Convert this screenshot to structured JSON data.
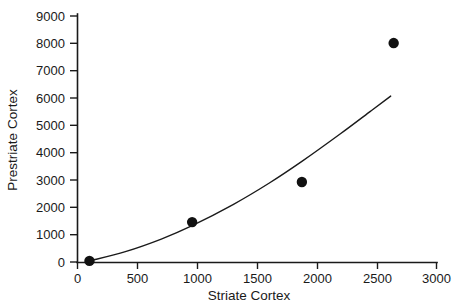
{
  "chart_data": {
    "type": "scatter",
    "title": "",
    "subtitle": "",
    "xlabel": "Striate Cortex",
    "ylabel": "Prestriate Cortex",
    "xlim": [
      0,
      3000
    ],
    "ylim": [
      0,
      9000
    ],
    "xticks": [
      0,
      500,
      1000,
      1500,
      2000,
      2500,
      3000
    ],
    "yticks": [
      0,
      1000,
      2000,
      3000,
      4000,
      5000,
      6000,
      7000,
      8000,
      9000
    ],
    "xticklabels": [
      "0",
      "500",
      "1000",
      "1500",
      "2000",
      "2500",
      "3000"
    ],
    "yticklabels": [
      "0",
      "1000",
      "2000",
      "3000",
      "4000",
      "5000",
      "6000",
      "7000",
      "8000",
      "9000"
    ],
    "grid": false,
    "legend": null,
    "series": [
      {
        "name": "observations",
        "type": "scatter",
        "marker": "filled-circle",
        "color": "#111111",
        "points": [
          {
            "x": 100,
            "y": 40
          },
          {
            "x": 958,
            "y": 1460
          },
          {
            "x": 1875,
            "y": 2925
          },
          {
            "x": 2642,
            "y": 8010
          }
        ]
      },
      {
        "name": "fitted-curve",
        "type": "line",
        "color": "#1a1a1a",
        "points": [
          {
            "x": 100,
            "y": 40
          },
          {
            "x": 400,
            "y": 380
          },
          {
            "x": 700,
            "y": 840
          },
          {
            "x": 958,
            "y": 1330
          },
          {
            "x": 1300,
            "y": 2100
          },
          {
            "x": 1600,
            "y": 2880
          },
          {
            "x": 1875,
            "y": 3680
          },
          {
            "x": 2200,
            "y": 4700
          },
          {
            "x": 2450,
            "y": 5520
          },
          {
            "x": 2617,
            "y": 6070
          }
        ]
      }
    ]
  },
  "axes": {
    "y_axis_label": "Prestriate Cortex",
    "x_axis_label": "Striate Cortex"
  }
}
